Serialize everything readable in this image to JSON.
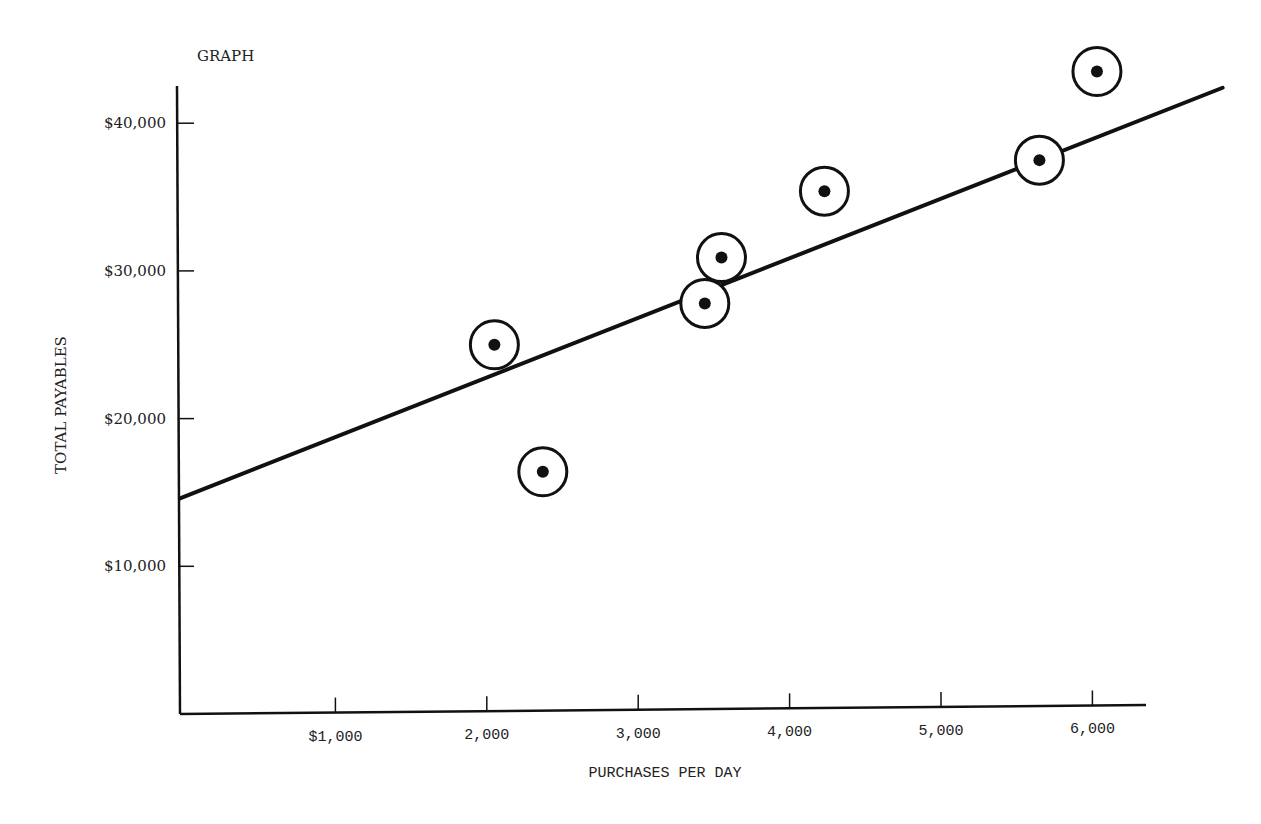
{
  "chart_data": {
    "type": "scatter",
    "title": "GRAPH",
    "xlabel": "PURCHASES PER DAY",
    "ylabel": "TOTAL PAYABLES",
    "x_ticks": [
      {
        "value": 1000,
        "label": "$1,000"
      },
      {
        "value": 2000,
        "label": "2,000"
      },
      {
        "value": 3000,
        "label": "3,000"
      },
      {
        "value": 4000,
        "label": "4,000"
      },
      {
        "value": 5000,
        "label": "5,000"
      },
      {
        "value": 6000,
        "label": "6,000"
      }
    ],
    "y_ticks": [
      {
        "value": 10000,
        "label": "$10,000"
      },
      {
        "value": 20000,
        "label": "$20,000"
      },
      {
        "value": 30000,
        "label": "$30,000"
      },
      {
        "value": 40000,
        "label": "$40,000"
      }
    ],
    "xlim": [
      0,
      6900
    ],
    "ylim": [
      0,
      42500
    ],
    "grid": false,
    "legend": null,
    "series": [
      {
        "name": "observations",
        "marker": "circled-dot",
        "points": [
          {
            "x": 2050,
            "y": 25000
          },
          {
            "x": 2370,
            "y": 16400
          },
          {
            "x": 3440,
            "y": 27800
          },
          {
            "x": 3550,
            "y": 30900
          },
          {
            "x": 4230,
            "y": 35400
          },
          {
            "x": 5650,
            "y": 37500
          },
          {
            "x": 6030,
            "y": 43500
          }
        ]
      }
    ],
    "trend_line": {
      "type": "linear",
      "start": {
        "x": 0,
        "y": 14600
      },
      "end": {
        "x": 6860,
        "y": 42400
      }
    }
  }
}
